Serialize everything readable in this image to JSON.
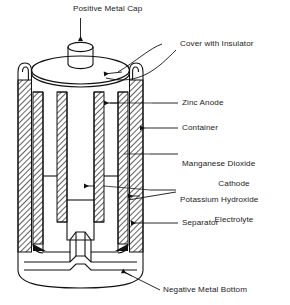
{
  "figure": {
    "type": "labeled-cross-section",
    "ink_color": "#111111",
    "background_color": "#ffffff",
    "hatch_color": "#2b2b2b"
  },
  "labels": {
    "positive_metal_cap": "Positive Metal Cap",
    "cover_with_insulator": "Cover with Insulator",
    "zinc_anode": "Zinc Anode",
    "container": "Container",
    "manganese_dioxide_cathode_line1": "Manganese Dioxide",
    "manganese_dioxide_cathode_line2": "Cathode",
    "potassium_hydroxide_electrolyte_line1": "Potassium Hydroxide",
    "potassium_hydroxide_electrolyte_line2": "Electrolyte",
    "separator": "Separator",
    "negative_metal_bottom": "Negative Metal Bottom"
  },
  "callouts": [
    {
      "name": "positive-metal-cap",
      "text": "Positive Metal Cap",
      "leader": "vertical-arrow-down"
    },
    {
      "name": "cover-with-insulator",
      "text": "Cover with Insulator",
      "leader": "curved-arrow-left"
    },
    {
      "name": "zinc-anode",
      "text": "Zinc Anode",
      "leader": "horizontal-line"
    },
    {
      "name": "container",
      "text": "Container",
      "leader": "horizontal-arrow-left"
    },
    {
      "name": "manganese-dioxide-cathode",
      "text": "Manganese Dioxide Cathode",
      "leader": "horizontal-line"
    },
    {
      "name": "potassium-hydroxide-electrolyte",
      "text": "Potassium Hydroxide Electrolyte",
      "leader": "double-arrow-left"
    },
    {
      "name": "separator",
      "text": "Separator",
      "leader": "horizontal-arrow-left"
    },
    {
      "name": "negative-metal-bottom",
      "text": "Negative Metal Bottom",
      "leader": "diagonal-line-up-left"
    }
  ]
}
